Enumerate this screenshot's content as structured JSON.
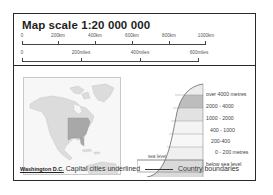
{
  "title": "Map scale  1:20 000 000",
  "scale_km": {
    "ticks": [
      "0",
      "200km",
      "400km",
      "600km",
      "800km",
      "1000km"
    ]
  },
  "scale_miles": {
    "ticks": [
      "0",
      "200miles",
      "400miles",
      "600miles"
    ]
  },
  "locator_map": {
    "region": "North America",
    "highlighted_area": "Eastern United States",
    "colors": {
      "land": "#dcdcdc",
      "highlight": "#a8a8a8",
      "sea": "#f7f7f7"
    }
  },
  "elevation_legend": {
    "bands": [
      {
        "label": "over 4000 metres",
        "color": "#ececec"
      },
      {
        "label": "2000 - 4000",
        "color": "#bdbdbd"
      },
      {
        "label": "1000 - 2000",
        "color": "#e2e2e2"
      },
      {
        "label": "400 - 1000",
        "color": "#f4f4f4"
      },
      {
        "label": "200-400",
        "color": "#f7f7f7"
      },
      {
        "label": "0 - 200 metres",
        "color": "#efefef"
      },
      {
        "label": "below sea level",
        "color": "#dadada"
      }
    ],
    "sea_level_label": "sea level"
  },
  "footer": {
    "capital_sample": "Washington D.C.",
    "capital_text": "Capital cities underlined",
    "boundary_text": "Country boundaries"
  }
}
